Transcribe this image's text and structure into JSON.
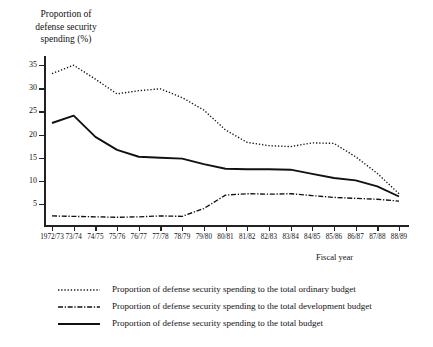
{
  "chart_data": {
    "type": "line",
    "title": "",
    "ylabel": "Proportion of defense security spending (%)",
    "xlabel": "Fiscal year",
    "grid": false,
    "legend_position": "bottom-left",
    "ylim": [
      0,
      37
    ],
    "yticks": [
      5,
      10,
      15,
      20,
      25,
      30,
      35
    ],
    "categories": [
      "1972/73",
      "73/74",
      "74/75",
      "75/76",
      "76/77",
      "77/78",
      "78/79",
      "79/80",
      "80/81",
      "81/82",
      "82/83",
      "83/84",
      "84/85",
      "85/86",
      "86/87",
      "87/88",
      "88/89"
    ],
    "series": [
      {
        "name": "Proportion of defense security spending to the total ordinary budget",
        "style": "dotted",
        "values": [
          33.2,
          35.0,
          32.0,
          28.8,
          29.5,
          29.9,
          28.0,
          25.3,
          21.0,
          18.3,
          17.6,
          17.4,
          18.2,
          18.1,
          15.2,
          11.6,
          7.2
        ]
      },
      {
        "name": "Proportion of defense security spending to the total development budget",
        "style": "dash-dot",
        "values": [
          2.4,
          2.3,
          2.2,
          2.1,
          2.2,
          2.4,
          2.3,
          4.0,
          6.9,
          7.2,
          7.1,
          7.2,
          6.8,
          6.4,
          6.2,
          6.0,
          5.6
        ]
      },
      {
        "name": "Proportion of defense security spending to the total budget",
        "style": "solid",
        "values": [
          22.5,
          24.1,
          19.5,
          16.7,
          15.2,
          15.0,
          14.8,
          13.6,
          12.6,
          12.5,
          12.5,
          12.4,
          11.5,
          10.6,
          10.1,
          8.8,
          6.6
        ]
      }
    ]
  },
  "legend": {
    "items": [
      {
        "style": "dotted",
        "label": "Proportion of defense security spending to the total ordinary budget"
      },
      {
        "style": "dash-dot",
        "label": "Proportion of defense security spending to the total development budget"
      },
      {
        "style": "solid",
        "label": "Proportion of defense security spending to the total budget"
      }
    ]
  },
  "axis": {
    "y_caption_line1": "Proportion of",
    "y_caption_line2": "defense security",
    "y_caption_line3": "spending (%)",
    "x_title": "Fiscal year"
  },
  "colors": {
    "ink": "#111111",
    "axis": "#222222",
    "background": "#ffffff"
  }
}
